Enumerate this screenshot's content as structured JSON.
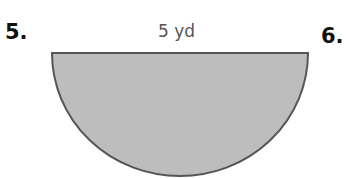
{
  "problems": [
    {
      "number": "5."
    },
    {
      "number": "6."
    }
  ],
  "figure": {
    "shape": "semicircle",
    "diameter_label": "5 yd",
    "fill_color": "#bdbdbd",
    "stroke_color": "#555555"
  }
}
